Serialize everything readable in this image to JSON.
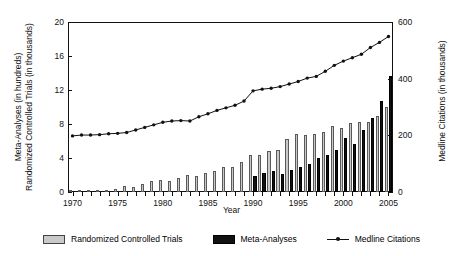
{
  "chart_data": {
    "type": "bar",
    "title": "",
    "xlabel": "Year",
    "ylabel": "Meta-Analyses (in hundreds)\nRandomized Controlled Trials (in thousands)",
    "ylabel_left_line1": "Meta-Analyses  (in hundreds)",
    "ylabel_left_line2": "Randomized Controlled Trials (in thousands)",
    "ylabel_right": "Medline Citations  (in thousands)",
    "grid": false,
    "legend_position": "bottom",
    "ylim": [
      0,
      20
    ],
    "yticks": [
      0,
      4,
      8,
      12,
      16,
      20
    ],
    "y2lim": [
      0,
      600
    ],
    "y2ticks": [
      0,
      200,
      400,
      600
    ],
    "xlim": [
      1970,
      2005
    ],
    "xticks": [
      1970,
      1975,
      1980,
      1985,
      1990,
      1995,
      2000,
      2005
    ],
    "xtick_labels": [
      "1970",
      "1975",
      "1980",
      "1985",
      "1990",
      "1995",
      "2000",
      "2005"
    ],
    "categories": [
      1970,
      1971,
      1972,
      1973,
      1974,
      1975,
      1976,
      1977,
      1978,
      1979,
      1980,
      1981,
      1982,
      1983,
      1984,
      1985,
      1986,
      1987,
      1988,
      1989,
      1990,
      1991,
      1992,
      1993,
      1994,
      1995,
      1996,
      1997,
      1998,
      1999,
      2000,
      2001,
      2002,
      2003,
      2004,
      2005
    ],
    "series": [
      {
        "name": "Randomized Controlled Trials",
        "axis": "left",
        "type": "bar",
        "color": "#c9c9c9",
        "values": [
          0.1,
          0.15,
          0.2,
          0.2,
          0.25,
          0.3,
          0.75,
          0.6,
          0.95,
          1.25,
          1.4,
          1.3,
          1.65,
          1.95,
          1.85,
          2.25,
          2.5,
          2.9,
          3.0,
          3.55,
          4.3,
          4.35,
          4.8,
          5.0,
          6.2,
          6.8,
          6.7,
          6.8,
          7.1,
          7.75,
          7.5,
          8.1,
          8.2,
          8.2,
          8.9,
          10.0
        ]
      },
      {
        "name": "Meta-Analyses",
        "axis": "left",
        "type": "bar",
        "color": "#111111",
        "values": [
          0,
          0,
          0,
          0,
          0,
          0,
          0,
          0,
          0,
          0,
          0,
          0,
          0,
          0,
          0,
          0,
          0,
          0,
          0,
          0,
          1.85,
          2.2,
          2.5,
          2.15,
          2.55,
          2.9,
          3.3,
          4.0,
          4.4,
          5.0,
          6.4,
          5.6,
          7.3,
          8.7,
          10.7,
          13.7
        ]
      },
      {
        "name": "Medline Citations",
        "axis": "right",
        "type": "line",
        "color": "#111111",
        "values": [
          6.6,
          6.7,
          6.7,
          6.75,
          6.85,
          6.9,
          7.0,
          7.3,
          7.6,
          7.9,
          8.2,
          8.35,
          8.4,
          8.35,
          8.85,
          9.2,
          9.6,
          9.9,
          10.2,
          10.7,
          11.9,
          12.1,
          12.2,
          12.4,
          12.7,
          13.0,
          13.4,
          13.6,
          14.2,
          14.9,
          15.4,
          15.8,
          16.2,
          17.0,
          17.6,
          18.3
        ],
        "values_thousands": [
          198,
          201,
          201,
          203,
          206,
          207,
          210,
          219,
          228,
          237,
          246,
          251,
          252,
          251,
          266,
          276,
          288,
          297,
          306,
          321,
          357,
          363,
          366,
          372,
          381,
          390,
          402,
          408,
          426,
          447,
          462,
          474,
          486,
          510,
          528,
          549
        ]
      }
    ]
  },
  "legend": {
    "items": [
      {
        "label": "Randomized Controlled Trials",
        "marker": "gray-square"
      },
      {
        "label": "Meta-Analyses",
        "marker": "black-square"
      },
      {
        "label": "Medline Citations",
        "marker": "line-with-dot"
      }
    ]
  }
}
